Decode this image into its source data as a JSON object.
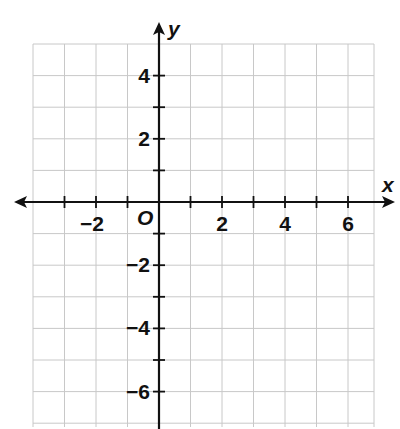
{
  "chart_data": {
    "type": "coordinate-grid",
    "title": "",
    "xlabel": "x",
    "ylabel": "y",
    "xlim": [
      -4,
      7
    ],
    "ylim": [
      -7,
      5
    ],
    "grid": true,
    "grid_step": 1,
    "x_ticks": [
      -3,
      -2,
      -1,
      1,
      2,
      3,
      4,
      5,
      6
    ],
    "y_ticks": [
      -6,
      -5,
      -4,
      -3,
      -2,
      -1,
      1,
      2,
      3,
      4
    ],
    "x_tick_labels": [
      {
        "value": -2,
        "text": "−2"
      },
      {
        "value": 2,
        "text": "2"
      },
      {
        "value": 4,
        "text": "4"
      },
      {
        "value": 6,
        "text": "6"
      }
    ],
    "y_tick_labels": [
      {
        "value": 4,
        "text": "4"
      },
      {
        "value": 2,
        "text": "2"
      },
      {
        "value": -2,
        "text": "−2"
      },
      {
        "value": -4,
        "text": "−4"
      },
      {
        "value": -6,
        "text": "−6"
      }
    ],
    "origin_label": "O",
    "series": [],
    "legend": null
  },
  "axes": {
    "x_name": "x",
    "y_name": "y",
    "origin": "O"
  },
  "colors": {
    "grid": "#c8c8c8",
    "axis": "#111111",
    "background": "#ffffff"
  }
}
